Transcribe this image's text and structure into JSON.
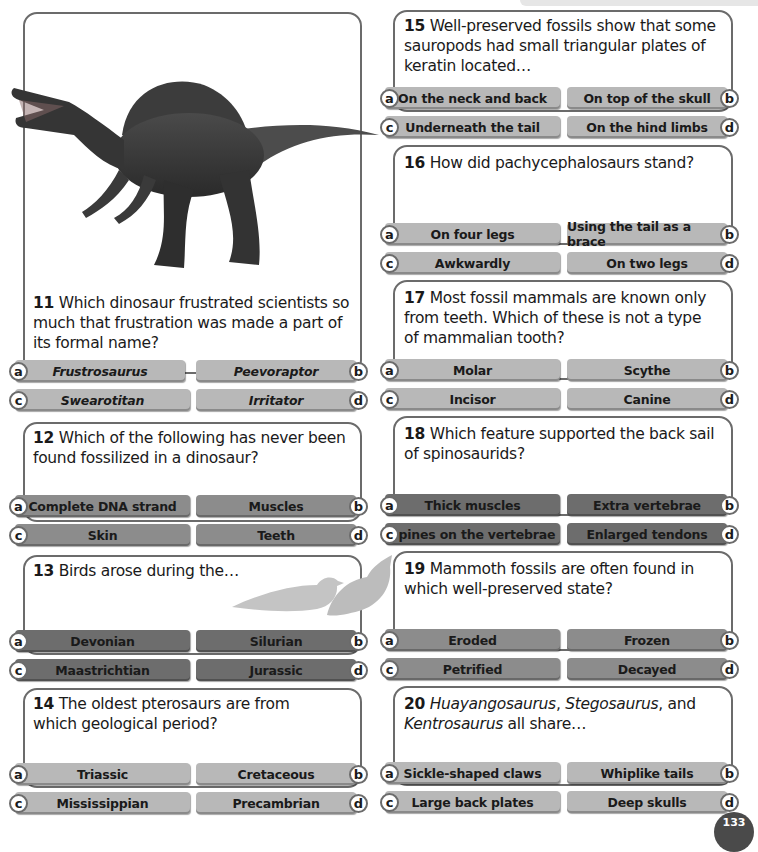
{
  "page": {
    "page_number": "133",
    "option_colors": {
      "light": "#b8b8b8",
      "mid": "#8c8c8c",
      "dark": "#6d6d6d"
    }
  },
  "images": {
    "spinosaurus": "spinosaurus-illustration",
    "birds": "bird-silhouettes"
  },
  "questions": [
    {
      "number": "11",
      "text": "Which dinosaur frustrated scientists so much that frustration was made a part of its formal name?",
      "lines": [
        "Which dinosaur frustrated scientists so",
        "much that frustration was made a part of",
        "its formal name?"
      ],
      "options": [
        {
          "letter": "a",
          "label": "Frustrosaurus"
        },
        {
          "letter": "b",
          "label": "Peevoraptor"
        },
        {
          "letter": "c",
          "label": "Swearotitan"
        },
        {
          "letter": "d",
          "label": "Irritator"
        }
      ]
    },
    {
      "number": "12",
      "text": "Which of the following has never been found fossilized in a dinosaur?",
      "lines": [
        "Which of the following has never been",
        "found fossilized in a dinosaur?"
      ],
      "options": [
        {
          "letter": "a",
          "label": "Complete DNA strand"
        },
        {
          "letter": "b",
          "label": "Muscles"
        },
        {
          "letter": "c",
          "label": "Skin"
        },
        {
          "letter": "d",
          "label": "Teeth"
        }
      ]
    },
    {
      "number": "13",
      "text": "Birds arose during the…",
      "lines": [
        "Birds arose during the…"
      ],
      "options": [
        {
          "letter": "a",
          "label": "Devonian"
        },
        {
          "letter": "b",
          "label": "Silurian"
        },
        {
          "letter": "c",
          "label": "Maastrichtian"
        },
        {
          "letter": "d",
          "label": "Jurassic"
        }
      ]
    },
    {
      "number": "14",
      "text": "The oldest pterosaurs are from which geological period?",
      "lines": [
        "The oldest pterosaurs are from",
        "which geological period?"
      ],
      "options": [
        {
          "letter": "a",
          "label": "Triassic"
        },
        {
          "letter": "b",
          "label": "Cretaceous"
        },
        {
          "letter": "c",
          "label": "Mississippian"
        },
        {
          "letter": "d",
          "label": "Precambrian"
        }
      ]
    },
    {
      "number": "15",
      "text": "Well-preserved fossils show that some sauropods had small triangular plates of keratin located…",
      "lines": [
        "Well-preserved fossils show that some",
        "sauropods had small triangular plates of",
        "keratin located…"
      ],
      "options": [
        {
          "letter": "a",
          "label": "On the neck and back"
        },
        {
          "letter": "b",
          "label": "On top of the skull"
        },
        {
          "letter": "c",
          "label": "Underneath the tail"
        },
        {
          "letter": "d",
          "label": "On the hind limbs"
        }
      ]
    },
    {
      "number": "16",
      "text": "How did pachycephalosaurs stand?",
      "lines": [
        "How did pachycephalosaurs stand?"
      ],
      "options": [
        {
          "letter": "a",
          "label": "On four legs"
        },
        {
          "letter": "b",
          "label": "Using the tail as a brace"
        },
        {
          "letter": "c",
          "label": "Awkwardly"
        },
        {
          "letter": "d",
          "label": "On two legs"
        }
      ]
    },
    {
      "number": "17",
      "text": "Most fossil mammals are known only from teeth. Which of these is not a type of mammalian tooth?",
      "lines": [
        "Most fossil mammals are known only",
        "from teeth. Which of these is not a type",
        "of mammalian tooth?"
      ],
      "options": [
        {
          "letter": "a",
          "label": "Molar"
        },
        {
          "letter": "b",
          "label": "Scythe"
        },
        {
          "letter": "c",
          "label": "Incisor"
        },
        {
          "letter": "d",
          "label": "Canine"
        }
      ]
    },
    {
      "number": "18",
      "text": "Which feature supported the back sail of spinosaurids?",
      "lines": [
        "Which feature supported the back sail",
        "of spinosaurids?"
      ],
      "options": [
        {
          "letter": "a",
          "label": "Thick muscles"
        },
        {
          "letter": "b",
          "label": "Extra vertebrae"
        },
        {
          "letter": "c",
          "label": "Spines on the vertebrae"
        },
        {
          "letter": "d",
          "label": "Enlarged tendons"
        }
      ]
    },
    {
      "number": "19",
      "text": "Mammoth fossils are often found in which well-preserved state?",
      "lines": [
        "Mammoth fossils are often found in",
        "which well-preserved state?"
      ],
      "options": [
        {
          "letter": "a",
          "label": "Eroded"
        },
        {
          "letter": "b",
          "label": "Frozen"
        },
        {
          "letter": "c",
          "label": "Petrified"
        },
        {
          "letter": "d",
          "label": "Decayed"
        }
      ]
    },
    {
      "number": "20",
      "text": "Huayangosaurus, Stegosaurus, and Kentrosaurus all share…",
      "line1": {
        "italic1": "Huayangosaurus",
        "sep1": ", ",
        "italic2": "Stegosaurus",
        "rest": ", and"
      },
      "line2": {
        "italic": "Kentrosaurus",
        "rest": " all share…"
      },
      "options": [
        {
          "letter": "a",
          "label": "Sickle-shaped claws"
        },
        {
          "letter": "b",
          "label": "Whiplike tails"
        },
        {
          "letter": "c",
          "label": "Large back plates"
        },
        {
          "letter": "d",
          "label": "Deep skulls"
        }
      ]
    }
  ]
}
